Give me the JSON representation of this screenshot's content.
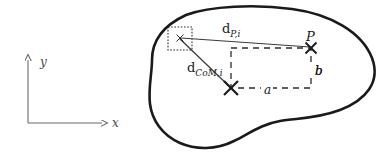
{
  "figure": {
    "type": "diagram",
    "caption_present": false,
    "background_color": "#ffffff",
    "width": 389,
    "height": 155
  },
  "axes": {
    "name": "coordinate-frame",
    "origin": {
      "x": 28,
      "y": 123
    },
    "x_axis": {
      "label": "x",
      "label_x": 113,
      "label_y": 124,
      "tip_x": 104,
      "tip_y": 123
    },
    "y_axis": {
      "label": "y",
      "label_x": 41,
      "label_y": 64,
      "tip_x": 28,
      "tip_y": 58
    },
    "stroke_color": "#6b6b6b",
    "stroke_width": 1.1
  },
  "blob": {
    "name": "irregular-region-outline",
    "stroke_color": "#1a1a1a",
    "stroke_width": 2.6,
    "fill": "none",
    "path": "M 186 15 C 210 6, 255 4, 292 9 C 330 14, 362 32, 372 58 C 381 82, 366 100, 340 110 C 316 119, 296 118, 280 121 C 262 124, 250 133, 234 141 C 216 150, 196 150, 180 143 C 162 135, 152 120, 150 104 C 148 88, 152 74, 152 60 C 152 44, 160 27, 186 15 Z"
  },
  "dotted_box": {
    "name": "cell-bounding-box",
    "x": 168,
    "y": 27,
    "width": 24,
    "height": 23,
    "stroke_color": "#2b2b2b",
    "dash": "1.6 1.6",
    "stroke_width": 1.1
  },
  "dashed_rect": {
    "name": "offset-rectangle",
    "x": 231,
    "y": 48,
    "width": 80,
    "height": 40,
    "stroke_color": "#2b2b2b",
    "dash": "6 5",
    "stroke_width": 1.3
  },
  "markers": [
    {
      "name": "marker-cell-center",
      "kind": "small-cross",
      "x": 180,
      "y": 38,
      "size": 3.5,
      "stroke_width": 1.0,
      "color": "#2b2b2b"
    },
    {
      "name": "marker-point-P",
      "kind": "cross",
      "x": 311,
      "y": 48,
      "size": 6,
      "stroke_width": 2.0,
      "color": "#1a1a1a"
    },
    {
      "name": "marker-center-of-mass",
      "kind": "cross",
      "x": 231,
      "y": 88,
      "size": 7,
      "stroke_width": 2.2,
      "color": "#1a1a1a"
    }
  ],
  "connectors": [
    {
      "name": "distance-line-to-P",
      "x1": 181,
      "y1": 38,
      "x2": 310,
      "y2": 47,
      "color": "#3a3a3a",
      "stroke_width": 1.1
    },
    {
      "name": "distance-line-to-CoM",
      "x1": 180,
      "y1": 39,
      "x2": 230,
      "y2": 87,
      "color": "#3a3a3a",
      "stroke_width": 1.2
    }
  ],
  "labels": {
    "d_P_i": {
      "name": "label-distance-to-point-P",
      "text_main": "d",
      "text_sub": "P,i",
      "x": 222,
      "y": 33,
      "font_size": 13,
      "sub_font_size": 9
    },
    "d_CoM_i": {
      "name": "label-distance-to-center-of-mass",
      "text_main": "d",
      "text_sub": "CoM,i",
      "x": 187,
      "y": 72,
      "font_size": 13,
      "sub_font_size": 9
    },
    "P": {
      "name": "label-point-P",
      "text": "P",
      "x": 308,
      "y": 40,
      "font_size": 13
    },
    "a": {
      "name": "label-side-a",
      "text": "a",
      "x": 267,
      "y": 93,
      "font_size": 12
    },
    "b": {
      "name": "label-side-b",
      "text": "b",
      "x": 316,
      "y": 72,
      "font_size": 12
    }
  }
}
